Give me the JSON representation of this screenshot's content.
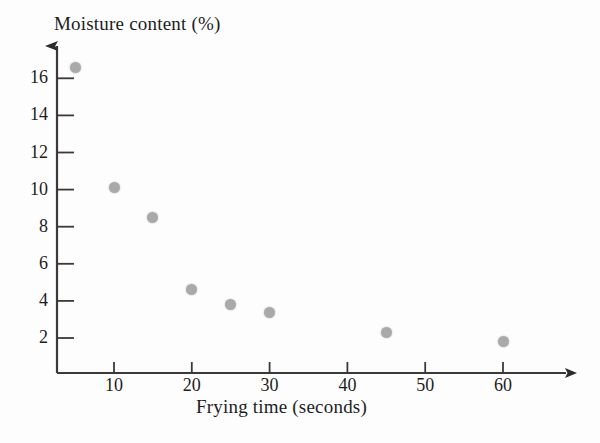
{
  "chart_data": {
    "type": "scatter",
    "title": "",
    "xlabel": "Frying time (seconds)",
    "ylabel": "Moisture content (%)",
    "x": [
      5,
      10,
      15,
      20,
      25,
      30,
      45,
      60
    ],
    "values": [
      16.6,
      10.1,
      8.5,
      4.6,
      3.8,
      3.35,
      2.3,
      1.8
    ],
    "points": [
      {
        "x": 5,
        "y": 16.6
      },
      {
        "x": 10,
        "y": 10.1
      },
      {
        "x": 15,
        "y": 8.5
      },
      {
        "x": 20,
        "y": 4.6
      },
      {
        "x": 25,
        "y": 3.8
      },
      {
        "x": 30,
        "y": 3.35
      },
      {
        "x": 45,
        "y": 2.3
      },
      {
        "x": 60,
        "y": 1.8
      }
    ],
    "xlim": [
      0,
      66
    ],
    "ylim": [
      0,
      17.6
    ],
    "xticks": [
      10,
      20,
      30,
      40,
      50,
      60
    ],
    "xtick_labels": [
      "10",
      "20",
      "30",
      "40",
      "50",
      "60"
    ],
    "yticks": [
      2,
      4,
      6,
      8,
      10,
      12,
      14,
      16
    ],
    "ytick_labels": [
      "2",
      "4",
      "6",
      "8",
      "10",
      "12",
      "14",
      "16"
    ],
    "grid": false,
    "legend": false,
    "marker_color": "#a9a9a9",
    "axis_color": "#3a3a3a",
    "arrow_heads": [
      "x-axis-right",
      "y-axis-top"
    ]
  },
  "axes": {
    "y_title": "Moisture content (%)",
    "x_title": "Frying time (seconds)"
  }
}
